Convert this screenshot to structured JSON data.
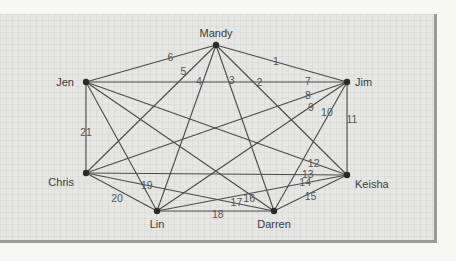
{
  "diagram": {
    "type": "complete-graph",
    "nodes": [
      {
        "id": "Mandy",
        "label": "Mandy"
      },
      {
        "id": "Jen",
        "label": "Jen"
      },
      {
        "id": "Jim",
        "label": "Jim"
      },
      {
        "id": "Chris",
        "label": "Chris"
      },
      {
        "id": "Keisha",
        "label": "Keisha"
      },
      {
        "id": "Lin",
        "label": "Lin"
      },
      {
        "id": "Darren",
        "label": "Darren"
      }
    ],
    "edges": [
      {
        "label": "1",
        "from": "Mandy",
        "to": "Jim"
      },
      {
        "label": "2",
        "from": "Mandy",
        "to": "Keisha"
      },
      {
        "label": "3",
        "from": "Mandy",
        "to": "Darren"
      },
      {
        "label": "4",
        "from": "Mandy",
        "to": "Lin"
      },
      {
        "label": "5",
        "from": "Mandy",
        "to": "Chris"
      },
      {
        "label": "6",
        "from": "Mandy",
        "to": "Jen"
      },
      {
        "label": "7",
        "from": "Jen",
        "to": "Jim"
      },
      {
        "label": "8",
        "from": "Jim",
        "to": "Chris"
      },
      {
        "label": "9",
        "from": "Jim",
        "to": "Lin"
      },
      {
        "label": "10",
        "from": "Jim",
        "to": "Darren"
      },
      {
        "label": "11",
        "from": "Jim",
        "to": "Keisha"
      },
      {
        "label": "12",
        "from": "Jen",
        "to": "Keisha"
      },
      {
        "label": "13",
        "from": "Chris",
        "to": "Keisha"
      },
      {
        "label": "14",
        "from": "Lin",
        "to": "Keisha"
      },
      {
        "label": "15",
        "from": "Darren",
        "to": "Keisha"
      },
      {
        "label": "16",
        "from": "Jen",
        "to": "Darren"
      },
      {
        "label": "17",
        "from": "Chris",
        "to": "Darren"
      },
      {
        "label": "18",
        "from": "Lin",
        "to": "Darren"
      },
      {
        "label": "19",
        "from": "Jen",
        "to": "Lin"
      },
      {
        "label": "20",
        "from": "Chris",
        "to": "Lin"
      },
      {
        "label": "21",
        "from": "Jen",
        "to": "Chris"
      }
    ]
  }
}
